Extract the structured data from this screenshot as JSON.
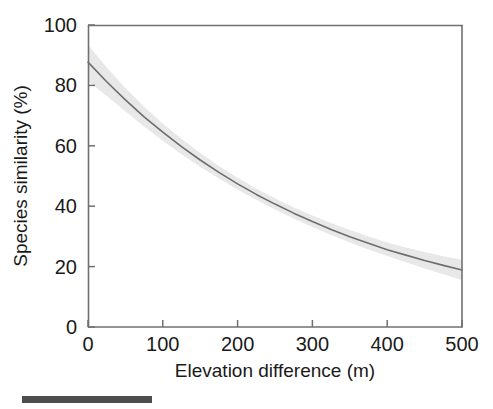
{
  "chart_data": {
    "type": "line",
    "title": "",
    "subtitle": "",
    "xlabel": "Elevation difference (m)",
    "ylabel": "Species similarity (%)",
    "xlim": [
      0,
      500
    ],
    "ylim": [
      0,
      100
    ],
    "xticks": [
      0,
      100,
      200,
      300,
      400,
      500
    ],
    "yticks": [
      0,
      20,
      40,
      60,
      80,
      100
    ],
    "xtick_labels": [
      "0",
      "100",
      "200",
      "300",
      "400",
      "500"
    ],
    "ytick_labels": [
      "0",
      "20",
      "40",
      "60",
      "80",
      "100"
    ],
    "grid": false,
    "legend": null,
    "legend_position": "none",
    "tick_direction": "in",
    "series": [
      {
        "name": "Fitted species similarity",
        "type": "line",
        "color": "#6e6e6e",
        "linewidth": 1.6,
        "x": [
          0,
          25,
          50,
          75,
          100,
          125,
          150,
          175,
          200,
          225,
          250,
          275,
          300,
          325,
          350,
          375,
          400,
          425,
          450,
          475,
          500
        ],
        "values": [
          87.7,
          81.2,
          75.2,
          69.6,
          64.5,
          59.7,
          55.3,
          51.2,
          47.4,
          43.9,
          40.7,
          37.7,
          34.9,
          32.3,
          29.9,
          27.7,
          25.6,
          23.8,
          22.0,
          20.4,
          18.9
        ]
      }
    ],
    "bands": [
      {
        "name": "Confidence interval",
        "color": "#e8e8e8",
        "opacity": 1,
        "x": [
          0,
          25,
          50,
          75,
          100,
          125,
          150,
          175,
          200,
          225,
          250,
          275,
          300,
          325,
          350,
          375,
          400,
          425,
          450,
          475,
          500
        ],
        "lower": [
          81.5,
          76.5,
          71.4,
          66.4,
          61.7,
          57.2,
          53.1,
          49.2,
          45.5,
          42.1,
          38.9,
          35.9,
          33.1,
          30.5,
          28.0,
          25.7,
          23.5,
          21.4,
          19.4,
          17.5,
          15.6
        ],
        "upper": [
          93.4,
          85.9,
          79.1,
          72.9,
          67.4,
          62.3,
          57.6,
          53.3,
          49.4,
          45.8,
          42.6,
          39.6,
          36.9,
          34.4,
          32.1,
          30.0,
          28.0,
          26.3,
          24.8,
          23.4,
          22.3
        ]
      }
    ],
    "annotations": [
      {
        "name": "scale-bar",
        "type": "rect",
        "color": "#4d4d4d",
        "x_px": 22,
        "y_px": 396,
        "width_px": 130,
        "height_px": 7
      }
    ],
    "axes_color": "#707070",
    "text_color": "#1a1a1a"
  }
}
